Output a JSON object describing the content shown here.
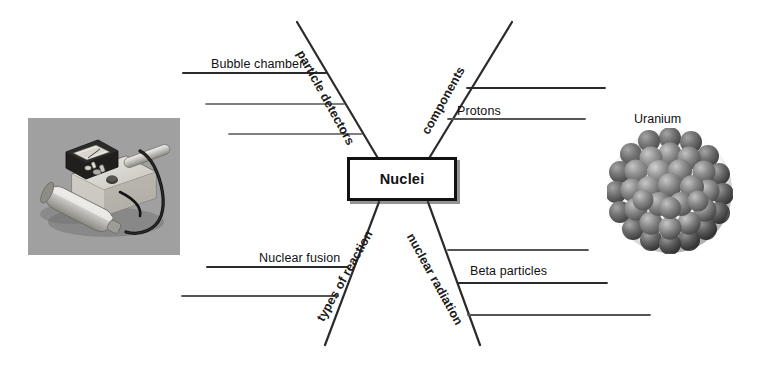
{
  "diagram": {
    "type": "mind-map",
    "center": {
      "label": "Nuclei"
    },
    "branches": [
      {
        "id": "particle-detectors",
        "label": "particle detectors",
        "position": "top-left",
        "sub_items": [
          {
            "label": "Bubble chamber",
            "filled": true
          },
          {
            "label": "",
            "filled": false
          },
          {
            "label": "",
            "filled": false
          }
        ]
      },
      {
        "id": "components",
        "label": "components",
        "position": "top-right",
        "sub_items": [
          {
            "label": "",
            "filled": false
          },
          {
            "label": "Protons",
            "filled": true
          }
        ]
      },
      {
        "id": "types-of-reaction",
        "label": "types of reaction",
        "position": "bottom-left",
        "sub_items": [
          {
            "label": "Nuclear fusion",
            "filled": true
          },
          {
            "label": "",
            "filled": false
          }
        ]
      },
      {
        "id": "nuclear-radiation",
        "label": "nuclear radiation",
        "position": "bottom-right",
        "sub_items": [
          {
            "label": "",
            "filled": false
          },
          {
            "label": "Beta particles",
            "filled": true
          },
          {
            "label": "",
            "filled": false
          }
        ]
      }
    ]
  },
  "figures": {
    "left": {
      "name": "geiger-counter-photo",
      "caption": ""
    },
    "right": {
      "name": "uranium-nucleus-illustration",
      "caption": "Uranium"
    }
  },
  "colors": {
    "background": "#ffffff",
    "ink": "#111111",
    "line": "#3a3a3a",
    "box_border": "#111111",
    "box_shadow": "#3c3c3c",
    "nucleon": "#7a7a7a",
    "photo_bg": "#9c9c9c"
  }
}
